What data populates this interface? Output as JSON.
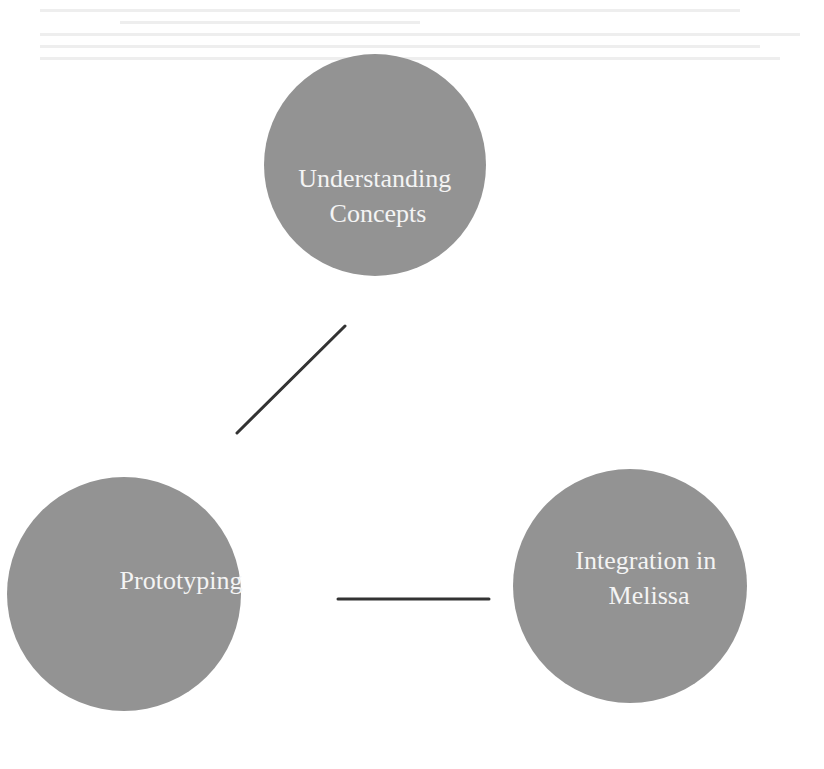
{
  "diagram": {
    "title": "",
    "node_color": "#939393",
    "label_color": "#f4f4f4",
    "edge_color": "#333333",
    "nodes": [
      {
        "id": "understanding",
        "lines": [
          "Understanding",
          "Concepts"
        ]
      },
      {
        "id": "prototyping",
        "lines": [
          "Prototyping"
        ]
      },
      {
        "id": "integration",
        "lines": [
          "Integration in",
          "Melissa"
        ]
      }
    ],
    "edges": [
      {
        "from": "understanding",
        "to": "prototyping"
      },
      {
        "from": "prototyping",
        "to": "integration"
      }
    ]
  }
}
